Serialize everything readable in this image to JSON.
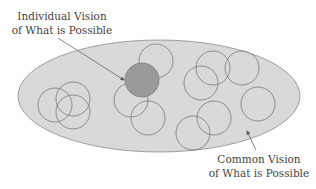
{
  "diagram": {
    "labels": {
      "individual_line1": "Individual Vision",
      "individual_line2": "of What is Possible",
      "common_line1": "Common Vision",
      "common_line2": "of What is Possible"
    },
    "colors": {
      "ellipse_fill": "#d9d9d9",
      "ellipse_stroke": "#8a8a8a",
      "circle_stroke": "#7a7a7a",
      "highlight_fill": "#9a9a9a",
      "text": "#444444"
    },
    "ellipse": {
      "cx": 159,
      "cy": 96,
      "rx": 141,
      "ry": 56
    },
    "highlight_circle": {
      "cx": 142,
      "cy": 80,
      "r": 17
    },
    "circles": [
      {
        "cx": 55,
        "cy": 105,
        "r": 17
      },
      {
        "cx": 73,
        "cy": 99,
        "r": 17
      },
      {
        "cx": 73,
        "cy": 112,
        "r": 17
      },
      {
        "cx": 156,
        "cy": 61,
        "r": 17
      },
      {
        "cx": 131,
        "cy": 100,
        "r": 17
      },
      {
        "cx": 148,
        "cy": 118,
        "r": 17
      },
      {
        "cx": 213,
        "cy": 68,
        "r": 17
      },
      {
        "cx": 242,
        "cy": 68,
        "r": 17
      },
      {
        "cx": 201,
        "cy": 83,
        "r": 17
      },
      {
        "cx": 258,
        "cy": 104,
        "r": 17
      },
      {
        "cx": 214,
        "cy": 118,
        "r": 17
      },
      {
        "cx": 193,
        "cy": 133,
        "r": 17
      }
    ]
  }
}
